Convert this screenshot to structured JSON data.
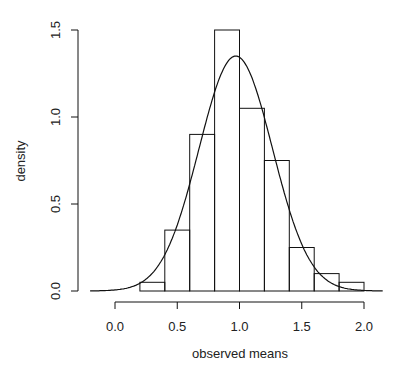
{
  "chart_data": {
    "type": "bar",
    "subtype": "histogram_with_density_curve",
    "title": "",
    "xlabel": "observed means",
    "ylabel": "density",
    "xlim": [
      -0.2,
      2.1
    ],
    "ylim": [
      0,
      1.5
    ],
    "x_ticks": [
      0.0,
      0.5,
      1.0,
      1.5,
      2.0
    ],
    "x_tick_labels": [
      "0.0",
      "0.5",
      "1.0",
      "1.5",
      "2.0"
    ],
    "y_ticks": [
      0.0,
      0.5,
      1.0,
      1.5
    ],
    "y_tick_labels": [
      "0.0",
      "0.5",
      "1.0",
      "1.5"
    ],
    "grid": false,
    "legend": null,
    "bin_edges": [
      0.2,
      0.4,
      0.6,
      0.8,
      1.0,
      1.2,
      1.4,
      1.6,
      1.8,
      2.0
    ],
    "categories": [
      "0.2-0.4",
      "0.4-0.6",
      "0.6-0.8",
      "0.8-1.0",
      "1.0-1.2",
      "1.2-1.4",
      "1.4-1.6",
      "1.6-1.8",
      "1.8-2.0"
    ],
    "values": [
      0.05,
      0.35,
      0.9,
      1.5,
      1.05,
      0.75,
      0.25,
      0.1,
      0.05
    ],
    "density_curve": {
      "type": "normal",
      "mean": 0.97,
      "sd": 0.295,
      "peak_density": 1.35,
      "x_range": [
        -0.2,
        2.15
      ]
    }
  }
}
